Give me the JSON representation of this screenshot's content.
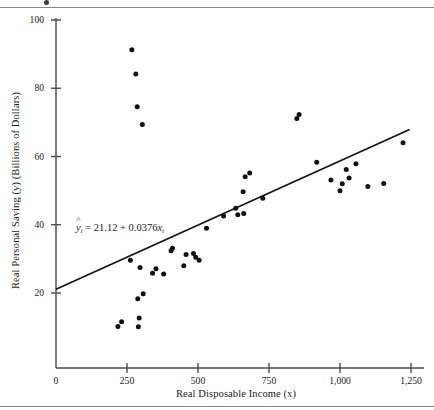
{
  "figure": {
    "title": "",
    "equation_html": "ŷt = 21.12 + 0.0376xt",
    "equation_parts": {
      "lhs_symbol": "y",
      "lhs_subscript": "t",
      "equals": "=",
      "intercept": "21.12",
      "plus": "+",
      "slope": "0.0376",
      "x_symbol": "x",
      "x_subscript": "t"
    }
  },
  "chart_data": {
    "type": "scatter",
    "title": "",
    "subtitle": "",
    "xlabel": "Real Disposable Income (x)",
    "ylabel": "Real Personal Saving (y) (Billions of Dollars)",
    "xlim": [
      0,
      1300
    ],
    "ylim": [
      0,
      105
    ],
    "xticks": [
      0,
      250,
      500,
      750,
      1000,
      1250
    ],
    "xticklabels": [
      "0",
      "250",
      "500",
      "750",
      "1,000",
      "1,250"
    ],
    "yticks": [
      20,
      40,
      60,
      80,
      100
    ],
    "yticklabels": [
      "20",
      "40",
      "60",
      "80",
      "100"
    ],
    "grid": false,
    "legend": "none",
    "annotations": [
      {
        "text": "ŷt = 21.12 + 0.0376xt",
        "x": 120,
        "y": 40
      }
    ],
    "fit_line": {
      "type": "line",
      "equation": "y = 21.12 + 0.0376x",
      "intercept": 21.12,
      "slope": 0.0376,
      "x_start": 0,
      "x_end": 1245,
      "y_start": 21.1,
      "y_end": 67.9
    },
    "points": [
      {
        "x": 218,
        "y": 10.2
      },
      {
        "x": 231,
        "y": 11.6
      },
      {
        "x": 262,
        "y": 29.6
      },
      {
        "x": 267,
        "y": 91.3
      },
      {
        "x": 281,
        "y": 84.2
      },
      {
        "x": 286,
        "y": 74.6
      },
      {
        "x": 288,
        "y": 18.3
      },
      {
        "x": 290,
        "y": 10.1
      },
      {
        "x": 293,
        "y": 12.7
      },
      {
        "x": 296,
        "y": 27.5
      },
      {
        "x": 304,
        "y": 69.4
      },
      {
        "x": 307,
        "y": 19.8
      },
      {
        "x": 340,
        "y": 25.8
      },
      {
        "x": 352,
        "y": 27.1
      },
      {
        "x": 379,
        "y": 25.6
      },
      {
        "x": 405,
        "y": 32.4
      },
      {
        "x": 410,
        "y": 33.1
      },
      {
        "x": 450,
        "y": 28.0
      },
      {
        "x": 458,
        "y": 31.3
      },
      {
        "x": 484,
        "y": 31.6
      },
      {
        "x": 492,
        "y": 30.5
      },
      {
        "x": 504,
        "y": 29.6
      },
      {
        "x": 530,
        "y": 39.0
      },
      {
        "x": 590,
        "y": 42.6
      },
      {
        "x": 633,
        "y": 44.8
      },
      {
        "x": 640,
        "y": 42.9
      },
      {
        "x": 659,
        "y": 49.7
      },
      {
        "x": 661,
        "y": 43.3
      },
      {
        "x": 666,
        "y": 54.1
      },
      {
        "x": 682,
        "y": 55.2
      },
      {
        "x": 728,
        "y": 47.8
      },
      {
        "x": 848,
        "y": 71.1
      },
      {
        "x": 856,
        "y": 72.3
      },
      {
        "x": 918,
        "y": 58.3
      },
      {
        "x": 968,
        "y": 53.1
      },
      {
        "x": 1000,
        "y": 50.0
      },
      {
        "x": 1008,
        "y": 52.0
      },
      {
        "x": 1022,
        "y": 56.2
      },
      {
        "x": 1032,
        "y": 53.7
      },
      {
        "x": 1056,
        "y": 57.9
      },
      {
        "x": 1098,
        "y": 51.2
      },
      {
        "x": 1154,
        "y": 52.1
      },
      {
        "x": 1222,
        "y": 64.0
      }
    ]
  },
  "style": {
    "point_color": "#111111",
    "line_color": "#111111",
    "axis_color": "#4a4a4a",
    "text_color": "#1a1a1a",
    "rule_color": "#8a8a8a",
    "background": "#ffffff"
  }
}
